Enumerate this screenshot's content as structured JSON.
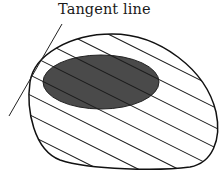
{
  "diagram": {
    "label": "Tangent line",
    "elements": [
      {
        "id": "outer-region",
        "shape": "closed-curve",
        "fill": "hatched",
        "hatch_direction": "diagonal-down-right"
      },
      {
        "id": "inner-region",
        "shape": "ellipse",
        "fill": "#4a4a4a"
      },
      {
        "id": "tangent-line",
        "shape": "line",
        "touches": "outer-region"
      }
    ],
    "colors": {
      "stroke": "#111111",
      "inner_fill": "#4a4a4a",
      "background": "#ffffff"
    }
  }
}
